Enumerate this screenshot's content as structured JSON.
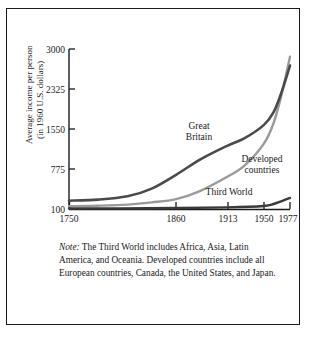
{
  "chart_data": {
    "type": "line",
    "title": "",
    "xlabel": "",
    "ylabel": "Average income per person\n(in 1960 U.S. dollars)",
    "ylabel_line1": "Average income per person",
    "ylabel_line2": "(in 1960 U.S. dollars)",
    "x_ticks": [
      "1750",
      "1860",
      "1913",
      "1950",
      "1977"
    ],
    "x_tick_values": [
      1750,
      1860,
      1913,
      1950,
      1977
    ],
    "y_ticks": [
      "100",
      "775",
      "1550",
      "2325",
      "3000"
    ],
    "y_tick_values": [
      100,
      775,
      1550,
      2325,
      3000
    ],
    "ylim": [
      100,
      3000
    ],
    "xlim": [
      1750,
      1977
    ],
    "grid": false,
    "legend_position": "inline-annotations",
    "series": [
      {
        "name": "Great Britain",
        "color": "#4a4a4a",
        "label_text_line1": "Great",
        "label_text_line2": "Britain",
        "x": [
          1750,
          1780,
          1810,
          1835,
          1860,
          1885,
          1913,
          1930,
          1950,
          1960,
          1968,
          1977
        ],
        "values": [
          250,
          270,
          330,
          470,
          720,
          1000,
          1250,
          1380,
          1620,
          1850,
          2200,
          2700
        ]
      },
      {
        "name": "Developed countries",
        "color": "#9a9a9a",
        "label_text_line1": "Developed",
        "label_text_line2": "countries",
        "x": [
          1750,
          1780,
          1810,
          1835,
          1860,
          1885,
          1913,
          1930,
          1950,
          1960,
          1968,
          1977
        ],
        "values": [
          150,
          160,
          180,
          220,
          280,
          430,
          690,
          880,
          1280,
          1650,
          2150,
          2860
        ]
      },
      {
        "name": "Third World",
        "color": "#3a3a3a",
        "label_text": "Third World",
        "x": [
          1750,
          1800,
          1860,
          1913,
          1950,
          1960,
          1968,
          1977
        ],
        "values": [
          110,
          112,
          118,
          130,
          155,
          190,
          240,
          300
        ]
      }
    ]
  },
  "note": {
    "label": "Note:",
    "text": "The Third World includes Africa, Asia, Latin America, and Oceania. Developed countries include all European countries, Canada, the United States, and Japan."
  },
  "colors": {
    "frame": "#1a1a1a",
    "axis": "#1a1a1a",
    "background": "#ffffff",
    "text": "#1a1a1a"
  }
}
